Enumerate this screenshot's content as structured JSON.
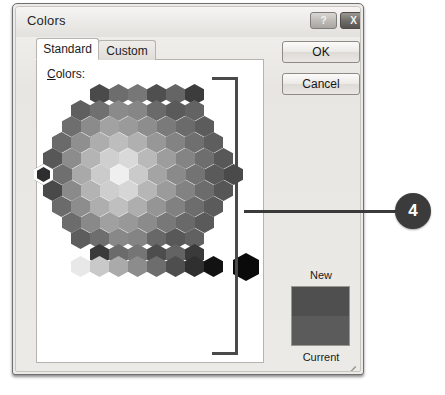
{
  "window": {
    "title": "Colors",
    "help_button_label": "?",
    "close_button_label": "X"
  },
  "tabs": [
    {
      "label": "Standard",
      "active": true
    },
    {
      "label": "Custom",
      "active": false
    }
  ],
  "panel": {
    "colors_label_accel": "C",
    "colors_label_rest": "olors:"
  },
  "buttons": {
    "ok_label": "OK",
    "cancel_label": "Cancel"
  },
  "preview": {
    "new_label": "New",
    "current_label": "Current",
    "new_color": "#4f4f4f",
    "current_color": "#5b5b5b"
  },
  "callout": {
    "number": "4",
    "badge_color": "#3b3b3b",
    "line_color": "#3a3a3a"
  },
  "annotation": {
    "bracket_color": "#4a4a4a"
  },
  "honeycomb": {
    "selected_index": {
      "row": 5,
      "col": 0
    },
    "selection_ring_color": "#ffffff",
    "hex_width": 19,
    "hex_height": 21,
    "rows": [
      {
        "offset": 47,
        "colors": [
          "#4a4a4a",
          "#6d6d6d",
          "#777777",
          "#4f4f4f",
          "#656565",
          "#3c3c3c"
        ]
      },
      {
        "offset": 28,
        "colors": [
          "#5f5f5f",
          "#707070",
          "#8a8a8a",
          "#868686",
          "#6a6a6a",
          "#5a5a5a",
          "#636363"
        ]
      },
      {
        "offset": 19,
        "colors": [
          "#6e6e6e",
          "#8b8b8b",
          "#a2a2a2",
          "#9a9a9a",
          "#8d8d8d",
          "#7a7a7a",
          "#6b6b6b",
          "#5c5c5c"
        ]
      },
      {
        "offset": 9,
        "colors": [
          "#6a6a6a",
          "#8f8f8f",
          "#adadad",
          "#bdbdbd",
          "#b0b0b0",
          "#979797",
          "#838383",
          "#6f6f6f",
          "#5e5e5e"
        ]
      },
      {
        "offset": 0,
        "colors": [
          "#575757",
          "#8c8c8c",
          "#b4b4b4",
          "#cfcfcf",
          "#d9d9d9",
          "#b9b9b9",
          "#9d9d9d",
          "#848484",
          "#6e6e6e",
          "#585858"
        ]
      },
      {
        "offset": -9,
        "colors": [
          "#2e2e2e",
          "#6f6f6f",
          "#a9a9a9",
          "#cbcbcb",
          "#efefef",
          "#cacaca",
          "#a4a4a4",
          "#8a8a8a",
          "#737373",
          "#5a5a5a",
          "#4a4a4a"
        ]
      },
      {
        "offset": 0,
        "colors": [
          "#494949",
          "#8a8a8a",
          "#b3b3b3",
          "#cecece",
          "#d6d6d6",
          "#b6b6b6",
          "#9b9b9b",
          "#828282",
          "#6c6c6c",
          "#565656"
        ]
      },
      {
        "offset": 9,
        "colors": [
          "#6b6b6b",
          "#8d8d8d",
          "#aeaeae",
          "#bfbfbf",
          "#aeaeae",
          "#959595",
          "#818181",
          "#6d6d6d",
          "#5b5b5b"
        ]
      },
      {
        "offset": 19,
        "colors": [
          "#6c6c6c",
          "#898989",
          "#a0a0a0",
          "#989898",
          "#8b8b8b",
          "#787878",
          "#696969",
          "#5a5a5a"
        ]
      },
      {
        "offset": 28,
        "colors": [
          "#5d5d5d",
          "#6e6e6e",
          "#888888",
          "#848484",
          "#686868",
          "#585858",
          "#616161"
        ]
      },
      {
        "offset": 47,
        "colors": [
          "#3a3a3a",
          "#6b6b6b",
          "#757575",
          "#4d4d4d",
          "#636363",
          "#3a3a3a"
        ]
      }
    ],
    "grayscale_row": {
      "offset": 28,
      "colors": [
        "#e8e8e8",
        "#c9c9c9",
        "#aaaaaa",
        "#8c8c8c",
        "#6d6d6d",
        "#4e4e4e",
        "#2f2f2f",
        "#121212"
      ],
      "extra_swatch": {
        "offset": 190,
        "color": "#0a0a0a"
      }
    }
  }
}
